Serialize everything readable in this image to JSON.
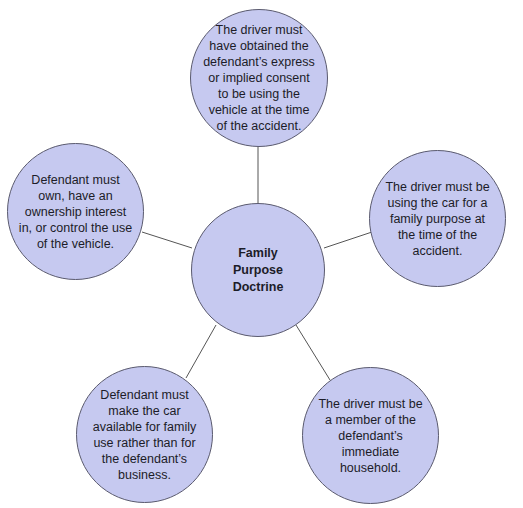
{
  "diagram": {
    "type": "hub-and-spoke",
    "center": {
      "label": "Family\nPurpose\nDoctrine"
    },
    "nodes": [
      {
        "position": "top",
        "text": "The  driver must\nhave obtained the\ndefendant’s express\nor implied consent\nto be using the\nvehicle at the time\nof the accident."
      },
      {
        "position": "left",
        "text": "Defendant must\nown, have an\nownership interest\nin, or control the use\nof the vehicle."
      },
      {
        "position": "right",
        "text": "The driver must be\nusing the car for a\nfamily purpose at\nthe time of the\naccident."
      },
      {
        "position": "bottom-left",
        "text": "Defendant must\nmake the car\navailable for family\nuse rather than for\nthe defendant’s\nbusiness."
      },
      {
        "position": "bottom-right",
        "text": "The  driver must be\na member of the\ndefendant’s immediate\nhousehold."
      }
    ],
    "colors": {
      "node_fill": "#c6c9f0",
      "node_border": "#5a5a6e",
      "connector": "#555555",
      "text": "#1c1c28"
    }
  }
}
